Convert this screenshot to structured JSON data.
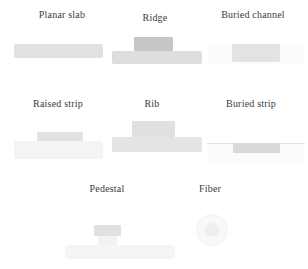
{
  "figure": {
    "items": [
      {
        "label": "Planar slab"
      },
      {
        "label": "Ridge"
      },
      {
        "label": "Buried channel"
      },
      {
        "label": "Raised strip"
      },
      {
        "label": "Rib"
      },
      {
        "label": "Buried strip"
      },
      {
        "label": "Pedestal"
      },
      {
        "label": "Fiber"
      }
    ]
  },
  "colors": {
    "background": "#ffffff",
    "label_text": "#3b3b3b",
    "ridge_block": "#c6c6c6",
    "slab_light": "#e1e1e1",
    "slab_mid": "#dedede",
    "buried_strip": "#d9d9d9",
    "substrate_faint": "#f4f4f4",
    "fiber_cladding": "#f8f8f8",
    "fiber_core": "#eeeeee"
  }
}
